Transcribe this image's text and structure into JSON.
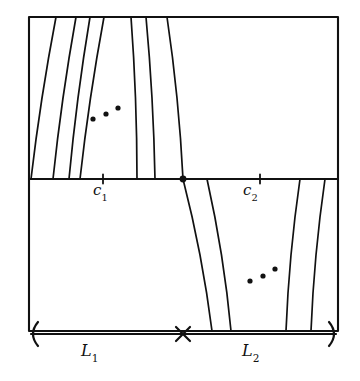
{
  "figure": {
    "kind": "mathematical-line-diagram",
    "background_color": "#ffffff",
    "stroke_color": "#111111",
    "labels": {
      "c1": {
        "base": "c",
        "sub": "1"
      },
      "c2": {
        "base": "c",
        "sub": "2"
      },
      "L1": {
        "base": "L",
        "sub": "1"
      },
      "L2": {
        "base": "L",
        "sub": "2"
      }
    },
    "frame": {
      "x": 29,
      "y": 17,
      "width": 309,
      "height": 314
    },
    "midline": {
      "y": 179,
      "x_start": 29,
      "x_end": 338
    },
    "junction_dot": {
      "x": 183,
      "y": 179,
      "r": 3.4
    },
    "ticks": [
      {
        "name": "tick-c1",
        "x": 103,
        "y": 179,
        "height": 9
      },
      {
        "name": "tick-c2",
        "x": 260,
        "y": 179,
        "height": 9
      }
    ],
    "upper_curves": [
      {
        "x_top": 56,
        "x_bottom": 31,
        "bow": -3
      },
      {
        "x_top": 76,
        "x_bottom": 53,
        "bow": -3
      },
      {
        "x_top": 90,
        "x_bottom": 69,
        "bow": -3
      },
      {
        "x_top": 104,
        "x_bottom": 80,
        "bow": -3
      },
      {
        "x_top": 131,
        "x_bottom": 137,
        "bow": 3
      },
      {
        "x_top": 146,
        "x_bottom": 155,
        "bow": 3
      },
      {
        "x_top": 167,
        "x_bottom": 183,
        "bow": 4
      }
    ],
    "lower_curves": [
      {
        "x_top": 183,
        "x_bottom": 212,
        "bow": 5
      },
      {
        "x_top": 207,
        "x_bottom": 231,
        "bow": 5
      },
      {
        "x_top": 300,
        "x_bottom": 286,
        "bow": -4
      },
      {
        "x_top": 325,
        "x_bottom": 311,
        "bow": -4
      }
    ],
    "ellipsis_upper": [
      {
        "x": 93,
        "y": 119,
        "r": 2.6
      },
      {
        "x": 106,
        "y": 114,
        "r": 2.6
      },
      {
        "x": 118,
        "y": 108,
        "r": 2.6
      }
    ],
    "ellipsis_lower": [
      {
        "x": 250,
        "y": 281,
        "r": 2.6
      },
      {
        "x": 263,
        "y": 276,
        "r": 2.6
      },
      {
        "x": 275,
        "y": 269,
        "r": 2.6
      }
    ],
    "bracket": {
      "y": 334,
      "x_left": 31,
      "x_right": 336,
      "cross_x": 183,
      "cross_size": 7
    }
  }
}
